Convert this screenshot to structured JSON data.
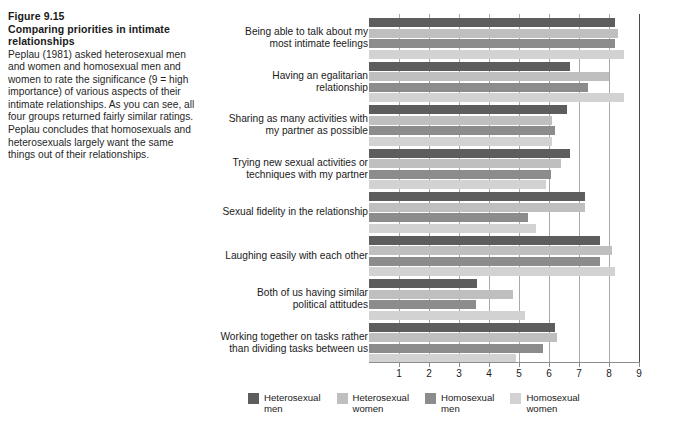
{
  "caption": {
    "figure_number": "Figure 9.15",
    "figure_title": "Comparing priorities in intimate relationships",
    "body": "Peplau (1981) asked heterosexual men and women and homosexual men and women to rate the significance (9 = high importance) of various aspects of their intimate relationships. As you can see, all four groups returned fairly similar ratings. Peplau concludes that homosexuals and heterosexuals largely want the same things out of their relationships."
  },
  "chart_data": {
    "type": "bar",
    "orientation": "horizontal",
    "title": "",
    "xlabel": "",
    "ylabel": "",
    "xlim": [
      0,
      9
    ],
    "grid": true,
    "legend_position": "bottom",
    "xticks": [
      "1",
      "2",
      "3",
      "4",
      "5",
      "6",
      "7",
      "8",
      "9"
    ],
    "categories": [
      "Being able to talk about my\nmost intimate feelings",
      "Having an egalitarian\nrelationship",
      "Sharing as many activities with\nmy partner as possible",
      "Trying new sexual activities or\ntechniques with my partner",
      "Sexual fidelity in the relationship",
      "Laughing easily with each other",
      "Both of us having similar\npolitical attitudes",
      "Working together on tasks rather\nthan dividing tasks between us"
    ],
    "series": [
      {
        "name": "Heterosexual\nmen",
        "color": "#5d5d5d",
        "values": [
          8.2,
          6.7,
          6.6,
          6.7,
          7.2,
          7.7,
          3.6,
          6.2
        ]
      },
      {
        "name": "Heterosexual\nwomen",
        "color": "#bfbfbf",
        "values": [
          8.3,
          8.0,
          6.1,
          6.4,
          7.2,
          8.1,
          4.8,
          6.25
        ]
      },
      {
        "name": "Homosexual\nmen",
        "color": "#8c8c8c",
        "values": [
          8.2,
          7.3,
          6.2,
          6.05,
          5.3,
          7.7,
          3.55,
          5.8
        ]
      },
      {
        "name": "Homosexual\nwomen",
        "color": "#d2d2d2",
        "values": [
          8.5,
          8.5,
          6.1,
          5.9,
          5.55,
          8.2,
          5.2,
          4.9
        ]
      }
    ]
  }
}
